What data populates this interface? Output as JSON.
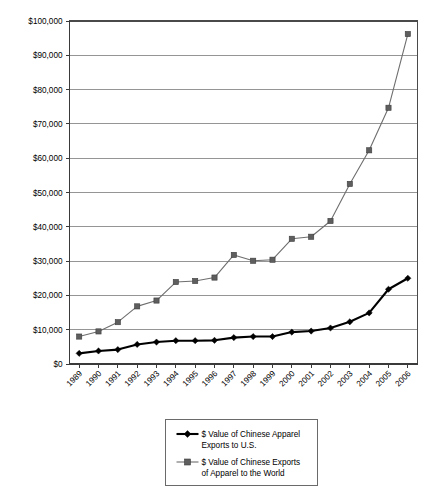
{
  "chart_data": {
    "type": "line",
    "title": "",
    "xlabel": "",
    "ylabel": "",
    "ylim": [
      0,
      100000
    ],
    "grid": true,
    "legend_position": "bottom",
    "categories": [
      "1989",
      "1990",
      "1991",
      "1992",
      "1993",
      "1994",
      "1995",
      "1996",
      "1997",
      "1998",
      "1999",
      "2000",
      "2001",
      "2002",
      "2003",
      "2004",
      "2005",
      "2006"
    ],
    "ytick_labels": [
      "$100,000",
      "$90,000",
      "$80,000",
      "$70,000",
      "$60,000",
      "$50,000",
      "$40,000",
      "$30,000",
      "$20,000",
      "$10,000",
      "$0"
    ],
    "ytick_values": [
      100000,
      90000,
      80000,
      70000,
      60000,
      50000,
      40000,
      30000,
      20000,
      10000,
      0
    ],
    "series": [
      {
        "name": "$ Value of Chinese Apparel Exports to U.S.",
        "marker": "diamond",
        "color": "#000000",
        "values": [
          3100,
          3800,
          4200,
          5700,
          6400,
          6800,
          6800,
          6900,
          7700,
          8000,
          8000,
          9300,
          9600,
          10500,
          12300,
          14900,
          21800,
          25000
        ]
      },
      {
        "name": "$ Value of Chinese Exports of Apparel to the World",
        "marker": "square",
        "color": "#5e5e5e",
        "values": [
          8000,
          9500,
          12200,
          16800,
          18500,
          23900,
          24200,
          25200,
          31800,
          30100,
          30400,
          36500,
          37100,
          41700,
          52500,
          62300,
          74700,
          96200
        ]
      }
    ]
  },
  "legend": {
    "entries": [
      {
        "line1": "$ Value of Chinese Apparel",
        "line2": "Exports to U.S.",
        "marker": "diamond-marker-icon"
      },
      {
        "line1": "$ Value of Chinese Exports",
        "line2": "of Apparel to the World",
        "marker": "square-marker-icon"
      }
    ]
  }
}
